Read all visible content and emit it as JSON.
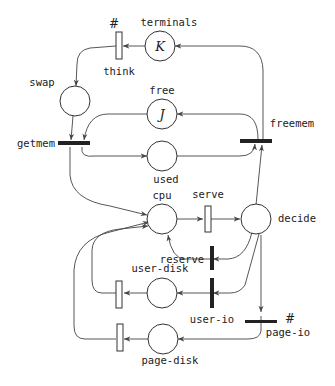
{
  "diagram": {
    "type": "petri-net",
    "places": [
      {
        "id": "terminals",
        "label": "terminals",
        "token": "K"
      },
      {
        "id": "swap",
        "label": "swap",
        "token": ""
      },
      {
        "id": "free",
        "label": "free",
        "token": "J"
      },
      {
        "id": "used",
        "label": "used",
        "token": ""
      },
      {
        "id": "cpu",
        "label": "cpu",
        "token": ""
      },
      {
        "id": "decide",
        "label": "decide",
        "token": ""
      },
      {
        "id": "user-disk",
        "label": "user-disk",
        "token": ""
      },
      {
        "id": "page-disk",
        "label": "page-disk",
        "token": ""
      }
    ],
    "transitions": [
      {
        "id": "think",
        "label": "think",
        "kind": "timed",
        "marker": "#"
      },
      {
        "id": "getmem",
        "label": "getmem",
        "kind": "immediate"
      },
      {
        "id": "freemem",
        "label": "freemem",
        "kind": "immediate"
      },
      {
        "id": "serve",
        "label": "serve",
        "kind": "timed"
      },
      {
        "id": "reserve",
        "label": "reserve",
        "kind": "immediate"
      },
      {
        "id": "user-io",
        "label": "user-io",
        "kind": "immediate"
      },
      {
        "id": "page-io",
        "label": "page-io",
        "kind": "immediate",
        "marker": "#"
      },
      {
        "id": "user-disk-done",
        "label": "",
        "kind": "timed"
      },
      {
        "id": "page-disk-done",
        "label": "",
        "kind": "timed"
      }
    ],
    "arcs": [
      [
        "terminals",
        "think"
      ],
      [
        "think",
        "swap"
      ],
      [
        "swap",
        "getmem"
      ],
      [
        "free",
        "getmem"
      ],
      [
        "getmem",
        "used"
      ],
      [
        "getmem",
        "cpu"
      ],
      [
        "cpu",
        "serve"
      ],
      [
        "serve",
        "decide"
      ],
      [
        "decide",
        "freemem"
      ],
      [
        "used",
        "freemem"
      ],
      [
        "freemem",
        "free"
      ],
      [
        "freemem",
        "terminals"
      ],
      [
        "decide",
        "reserve"
      ],
      [
        "reserve",
        "cpu"
      ],
      [
        "decide",
        "user-io"
      ],
      [
        "user-io",
        "user-disk"
      ],
      [
        "user-disk",
        "user-disk-done"
      ],
      [
        "user-disk-done",
        "cpu"
      ],
      [
        "decide",
        "page-io"
      ],
      [
        "page-io",
        "page-disk"
      ],
      [
        "page-disk",
        "page-disk-done"
      ],
      [
        "page-disk-done",
        "cpu"
      ]
    ]
  }
}
